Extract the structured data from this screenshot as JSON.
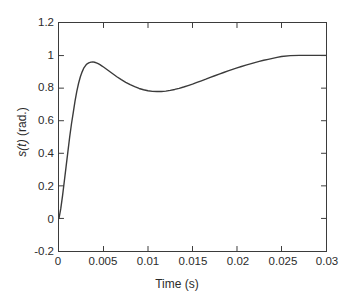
{
  "chart_data": {
    "type": "line",
    "title": "",
    "xlabel": "Time (s)",
    "ylabel": "s(t) (rad.)",
    "ylabel_italic_part": "s(t)",
    "ylabel_plain_part": " (rad.)",
    "xlim": [
      0,
      0.03
    ],
    "ylim": [
      -0.2,
      1.2
    ],
    "grid": false,
    "legend": null,
    "legend_position": "none",
    "line_color": "#3b3b3b",
    "background_color": "#ffffff",
    "axis_color": "#3b3b3b",
    "xticks": [
      0,
      0.005,
      0.01,
      0.015,
      0.02,
      0.025,
      0.03
    ],
    "xtick_labels": [
      "0",
      "0.005",
      "0.01",
      "0.015",
      "0.02",
      "0.025",
      "0.03"
    ],
    "yticks": [
      -0.2,
      0,
      0.2,
      0.4,
      0.6,
      0.8,
      1,
      1.2
    ],
    "ytick_labels": [
      "-0.2",
      "0",
      "0.2",
      "0.4",
      "0.6",
      "0.8",
      "1",
      "1.2"
    ],
    "series": [
      {
        "name": "s(t)",
        "x": [
          0,
          0.0002,
          0.0004,
          0.0006,
          0.0008,
          0.001,
          0.0012,
          0.0014,
          0.0016,
          0.0018,
          0.002,
          0.0022,
          0.0024,
          0.0026,
          0.0028,
          0.003,
          0.0032,
          0.0034,
          0.0036,
          0.0038,
          0.004,
          0.0042,
          0.0044,
          0.0046,
          0.0048,
          0.005,
          0.0055,
          0.006,
          0.0065,
          0.007,
          0.0075,
          0.008,
          0.0085,
          0.009,
          0.0095,
          0.01,
          0.0105,
          0.011,
          0.0115,
          0.012,
          0.0125,
          0.013,
          0.0135,
          0.014,
          0.0145,
          0.015,
          0.0155,
          0.016,
          0.0165,
          0.017,
          0.0175,
          0.018,
          0.0185,
          0.019,
          0.0195,
          0.02,
          0.0205,
          0.021,
          0.0215,
          0.022,
          0.0225,
          0.023,
          0.0235,
          0.024,
          0.0245,
          0.025,
          0.026,
          0.027,
          0.028,
          0.029,
          0.03
        ],
        "y": [
          0.0,
          0.06,
          0.14,
          0.23,
          0.32,
          0.41,
          0.5,
          0.58,
          0.65,
          0.72,
          0.78,
          0.83,
          0.87,
          0.9,
          0.925,
          0.94,
          0.951,
          0.957,
          0.96,
          0.961,
          0.959,
          0.955,
          0.95,
          0.944,
          0.937,
          0.93,
          0.91,
          0.89,
          0.87,
          0.852,
          0.836,
          0.821,
          0.809,
          0.798,
          0.79,
          0.784,
          0.78,
          0.779,
          0.779,
          0.782,
          0.786,
          0.792,
          0.799,
          0.807,
          0.816,
          0.825,
          0.835,
          0.845,
          0.855,
          0.866,
          0.876,
          0.886,
          0.896,
          0.906,
          0.915,
          0.924,
          0.933,
          0.941,
          0.949,
          0.957,
          0.964,
          0.971,
          0.977,
          0.983,
          0.989,
          0.994,
          1.0,
          1.001,
          1.001,
          1.001,
          1.001
        ],
        "annotations": [
          {
            "label": "overshoot peak",
            "x": 0.0038,
            "y": 0.961
          },
          {
            "label": "undershoot trough",
            "x": 0.011,
            "y": 0.779
          },
          {
            "label": "settling value",
            "x": 0.026,
            "y": 1.0
          }
        ]
      }
    ]
  },
  "figure": {
    "x_axis_title": "Time (s)",
    "y_axis_title_italic": "s(t)",
    "y_axis_title_plain": " (rad.)"
  }
}
